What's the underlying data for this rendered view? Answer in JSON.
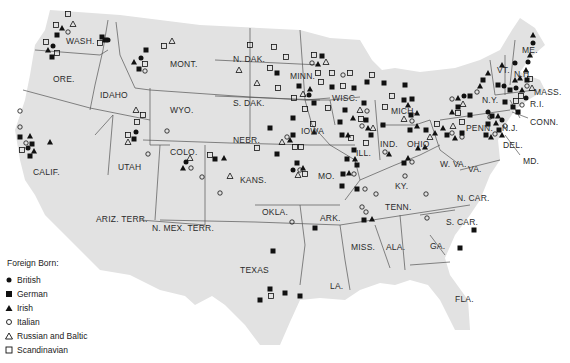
{
  "legend": {
    "title": "Foreign Born:",
    "items": [
      {
        "symbol": "filled-circle",
        "label": "British"
      },
      {
        "symbol": "filled-square",
        "label": "German"
      },
      {
        "symbol": "filled-triangle",
        "label": "Irish"
      },
      {
        "symbol": "open-circle",
        "label": "Italian"
      },
      {
        "symbol": "open-triangle",
        "label": "Russian and Baltic"
      },
      {
        "symbol": "open-square",
        "label": "Scandinavian"
      }
    ]
  },
  "colors": {
    "land": "#e2e2e2",
    "border": "#555555",
    "marker": "#111111",
    "water": "#ffffff"
  },
  "states": [
    {
      "label": "WASH.",
      "x": 66,
      "y": 37
    },
    {
      "label": "ORE.",
      "x": 53,
      "y": 75
    },
    {
      "label": "IDAHO",
      "x": 100,
      "y": 91
    },
    {
      "label": "MONT.",
      "x": 170,
      "y": 60
    },
    {
      "label": "WYO.",
      "x": 170,
      "y": 106
    },
    {
      "label": "CALIF.",
      "x": 33,
      "y": 168
    },
    {
      "label": "UTAH",
      "x": 118,
      "y": 163
    },
    {
      "label": "COLO.",
      "x": 170,
      "y": 148
    },
    {
      "label": "N. DAK.",
      "x": 233,
      "y": 55
    },
    {
      "label": "S. DAK.",
      "x": 233,
      "y": 99
    },
    {
      "label": "NEBR.",
      "x": 233,
      "y": 136
    },
    {
      "label": "KANS.",
      "x": 240,
      "y": 176
    },
    {
      "label": "MINN.",
      "x": 290,
      "y": 72
    },
    {
      "label": "IOWA",
      "x": 301,
      "y": 127
    },
    {
      "label": "WISC.",
      "x": 332,
      "y": 94
    },
    {
      "label": "MO.",
      "x": 318,
      "y": 172
    },
    {
      "label": "ILL.",
      "x": 356,
      "y": 149
    },
    {
      "label": "IND.",
      "x": 380,
      "y": 140
    },
    {
      "label": "OHIO",
      "x": 407,
      "y": 140
    },
    {
      "label": "MICH.",
      "x": 391,
      "y": 107
    },
    {
      "label": "KY.",
      "x": 395,
      "y": 182
    },
    {
      "label": "TENN.",
      "x": 385,
      "y": 203
    },
    {
      "label": "W. VA.",
      "x": 440,
      "y": 160
    },
    {
      "label": "VA.",
      "x": 468,
      "y": 165
    },
    {
      "label": "N. CAR.",
      "x": 457,
      "y": 194
    },
    {
      "label": "S. CAR.",
      "x": 446,
      "y": 218
    },
    {
      "label": "GA.",
      "x": 430,
      "y": 242
    },
    {
      "label": "FLA.",
      "x": 455,
      "y": 295
    },
    {
      "label": "ALA.",
      "x": 386,
      "y": 243
    },
    {
      "label": "MISS.",
      "x": 351,
      "y": 243
    },
    {
      "label": "LA.",
      "x": 330,
      "y": 282
    },
    {
      "label": "ARK.",
      "x": 320,
      "y": 214
    },
    {
      "label": "OKLA.",
      "x": 262,
      "y": 208
    },
    {
      "label": "TEXAS",
      "x": 240,
      "y": 266
    },
    {
      "label": "ARIZ. TERR.",
      "x": 96,
      "y": 215
    },
    {
      "label": "N. MEX. TERR.",
      "x": 152,
      "y": 224
    },
    {
      "label": "N.Y.",
      "x": 482,
      "y": 96
    },
    {
      "label": "PENN.",
      "x": 466,
      "y": 124
    },
    {
      "label": "N.J.",
      "x": 502,
      "y": 124
    },
    {
      "label": "DEL.",
      "x": 503,
      "y": 141
    },
    {
      "label": "MD.",
      "x": 523,
      "y": 157
    },
    {
      "label": "CONN.",
      "x": 530,
      "y": 118
    },
    {
      "label": "R.I.",
      "x": 530,
      "y": 100
    },
    {
      "label": "MASS.",
      "x": 534,
      "y": 88
    },
    {
      "label": "N.H.",
      "x": 514,
      "y": 70
    },
    {
      "label": "VT.",
      "x": 497,
      "y": 66
    },
    {
      "label": "ME.",
      "x": 522,
      "y": 46
    }
  ]
}
